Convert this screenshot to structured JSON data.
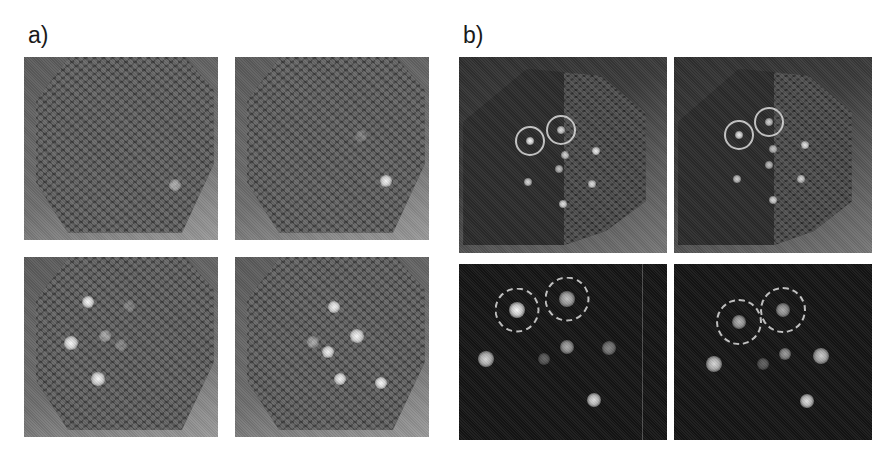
{
  "figure": {
    "labels": {
      "a": "a)",
      "b": "b)"
    },
    "colors": {
      "background": "#ffffff",
      "brightfield_bg": "#6d6d6d",
      "chip_dark": "#3c3c3c",
      "fluorescence_bg": "#141414",
      "spot": "#f2f2f2",
      "ring": "#e1e1e1"
    },
    "panels": [
      {
        "id": "a1",
        "group": "a",
        "type": "brightfield",
        "box": [
          24,
          57,
          194,
          183
        ],
        "spots": [
          {
            "x": 78,
            "y": 70,
            "r": 6,
            "i": 0.55
          }
        ],
        "rings": []
      },
      {
        "id": "a2",
        "group": "a",
        "type": "brightfield",
        "box": [
          235,
          57,
          194,
          183
        ],
        "spots": [
          {
            "x": 78,
            "y": 68,
            "r": 6,
            "i": 1.0
          },
          {
            "x": 65,
            "y": 43,
            "r": 6,
            "i": 0.25
          }
        ],
        "rings": []
      },
      {
        "id": "a3",
        "group": "a",
        "type": "brightfield",
        "box": [
          24,
          257,
          194,
          180
        ],
        "spots": [
          {
            "x": 33,
            "y": 25,
            "r": 6,
            "i": 1.0
          },
          {
            "x": 24,
            "y": 48,
            "r": 7,
            "i": 1.0
          },
          {
            "x": 38,
            "y": 68,
            "r": 7,
            "i": 1.0
          },
          {
            "x": 42,
            "y": 44,
            "r": 6,
            "i": 0.5
          },
          {
            "x": 50,
            "y": 49,
            "r": 6,
            "i": 0.3
          },
          {
            "x": 54,
            "y": 27,
            "r": 6,
            "i": 0.25
          }
        ],
        "rings": []
      },
      {
        "id": "a4",
        "group": "a",
        "type": "brightfield",
        "box": [
          235,
          257,
          194,
          180
        ],
        "spots": [
          {
            "x": 51,
            "y": 28,
            "r": 6,
            "i": 1.0
          },
          {
            "x": 63,
            "y": 44,
            "r": 7,
            "i": 1.0
          },
          {
            "x": 48,
            "y": 53,
            "r": 6,
            "i": 1.0
          },
          {
            "x": 40,
            "y": 47,
            "r": 6,
            "i": 0.5
          },
          {
            "x": 54,
            "y": 68,
            "r": 6,
            "i": 1.0
          },
          {
            "x": 75,
            "y": 70,
            "r": 6,
            "i": 1.0
          }
        ],
        "rings": []
      },
      {
        "id": "b1",
        "group": "b",
        "type": "brightfield-dark",
        "box": [
          459,
          57,
          208,
          196
        ],
        "spots": [
          {
            "x": 34,
            "y": 43,
            "r": 4,
            "i": 1.0
          },
          {
            "x": 49,
            "y": 37,
            "r": 4,
            "i": 0.9
          },
          {
            "x": 51,
            "y": 50,
            "r": 4,
            "i": 0.8
          },
          {
            "x": 66,
            "y": 48,
            "r": 4,
            "i": 0.95
          },
          {
            "x": 48,
            "y": 57,
            "r": 4,
            "i": 0.75
          },
          {
            "x": 33,
            "y": 64,
            "r": 4,
            "i": 0.85
          },
          {
            "x": 64,
            "y": 65,
            "r": 4,
            "i": 0.85
          },
          {
            "x": 50,
            "y": 75,
            "r": 4,
            "i": 0.9
          }
        ],
        "rings": [
          {
            "x": 34,
            "y": 43,
            "d": 30,
            "style": "solid"
          },
          {
            "x": 49,
            "y": 37,
            "d": 30,
            "style": "solid"
          }
        ]
      },
      {
        "id": "b2",
        "group": "b",
        "type": "brightfield-dark",
        "box": [
          674,
          57,
          198,
          196
        ],
        "spots": [
          {
            "x": 33,
            "y": 40,
            "r": 4,
            "i": 0.95
          },
          {
            "x": 48,
            "y": 33,
            "r": 4,
            "i": 0.85
          },
          {
            "x": 50,
            "y": 47,
            "r": 4,
            "i": 0.75
          },
          {
            "x": 66,
            "y": 45,
            "r": 4,
            "i": 0.9
          },
          {
            "x": 48,
            "y": 55,
            "r": 4,
            "i": 0.75
          },
          {
            "x": 32,
            "y": 62,
            "r": 4,
            "i": 0.8
          },
          {
            "x": 64,
            "y": 62,
            "r": 4,
            "i": 0.8
          },
          {
            "x": 50,
            "y": 73,
            "r": 4,
            "i": 0.85
          }
        ],
        "rings": [
          {
            "x": 33,
            "y": 40,
            "d": 30,
            "style": "solid"
          },
          {
            "x": 48,
            "y": 33,
            "d": 30,
            "style": "solid"
          }
        ]
      },
      {
        "id": "b3",
        "group": "b",
        "type": "fluorescence",
        "box": [
          459,
          264,
          208,
          176
        ],
        "spots": [
          {
            "x": 28,
            "y": 26,
            "r": 8,
            "i": 1.0
          },
          {
            "x": 52,
            "y": 20,
            "r": 8,
            "i": 0.75
          },
          {
            "x": 13,
            "y": 54,
            "r": 8,
            "i": 0.85
          },
          {
            "x": 41,
            "y": 54,
            "r": 6,
            "i": 0.35
          },
          {
            "x": 52,
            "y": 47,
            "r": 7,
            "i": 0.65
          },
          {
            "x": 72,
            "y": 48,
            "r": 7,
            "i": 0.5
          },
          {
            "x": 65,
            "y": 77,
            "r": 7,
            "i": 0.9
          }
        ],
        "rings": [
          {
            "x": 28,
            "y": 26,
            "d": 45,
            "style": "dashed"
          },
          {
            "x": 52,
            "y": 20,
            "d": 45,
            "style": "dashed"
          }
        ],
        "vline_x": 88
      },
      {
        "id": "b4",
        "group": "b",
        "type": "fluorescence",
        "box": [
          674,
          264,
          198,
          176
        ],
        "spots": [
          {
            "x": 33,
            "y": 33,
            "r": 7,
            "i": 0.7
          },
          {
            "x": 55,
            "y": 26,
            "r": 7,
            "i": 0.65
          },
          {
            "x": 20,
            "y": 57,
            "r": 8,
            "i": 0.85
          },
          {
            "x": 45,
            "y": 57,
            "r": 6,
            "i": 0.35
          },
          {
            "x": 56,
            "y": 51,
            "r": 6,
            "i": 0.6
          },
          {
            "x": 74,
            "y": 52,
            "r": 8,
            "i": 0.8
          },
          {
            "x": 67,
            "y": 78,
            "r": 7,
            "i": 0.9
          }
        ],
        "rings": [
          {
            "x": 33,
            "y": 33,
            "d": 46,
            "style": "dashed"
          },
          {
            "x": 55,
            "y": 26,
            "d": 46,
            "style": "dashed"
          }
        ]
      }
    ]
  }
}
